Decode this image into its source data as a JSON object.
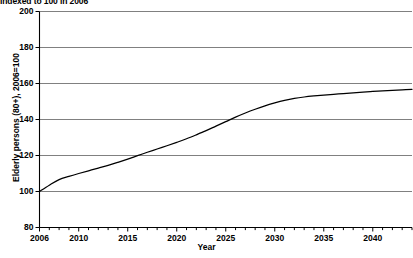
{
  "chart_data": {
    "type": "line",
    "title": "Indexed to 100 in 2006",
    "xlabel": "Year",
    "ylabel": "Elderly persons (80+), 2006=100",
    "xlim": [
      2006,
      2044
    ],
    "ylim": [
      80,
      200
    ],
    "grid": true,
    "legend": "none",
    "y_ticks": [
      80,
      100,
      120,
      140,
      160,
      180,
      200
    ],
    "x_ticks": [
      2006,
      2010,
      2015,
      2020,
      2025,
      2030,
      2035,
      2040
    ],
    "x_minor_tick_interval": 1,
    "line_color": "#000000",
    "grid_color": "#808080",
    "series": [
      {
        "name": "Elderly persons (80+)",
        "x": [
          2006,
          2007,
          2008,
          2009,
          2010,
          2011,
          2012,
          2013,
          2014,
          2015,
          2016,
          2017,
          2018,
          2019,
          2020,
          2021,
          2022,
          2023,
          2024,
          2025,
          2026,
          2027,
          2028,
          2029,
          2030,
          2031,
          2032,
          2033,
          2034,
          2035,
          2036,
          2037,
          2038,
          2039,
          2040,
          2041,
          2042,
          2043,
          2044
        ],
        "values": [
          100.0,
          103.5,
          106.6,
          108.4,
          110.0,
          111.5,
          113.0,
          114.5,
          116.2,
          118.0,
          119.9,
          121.8,
          123.6,
          125.4,
          127.3,
          129.3,
          131.5,
          133.8,
          136.3,
          138.8,
          141.3,
          143.6,
          145.7,
          147.6,
          149.2,
          150.6,
          151.7,
          152.5,
          153.1,
          153.6,
          154.0,
          154.4,
          154.8,
          155.2,
          155.6,
          155.9,
          156.2,
          156.5,
          156.8
        ]
      }
    ]
  },
  "axis": {
    "y_labels": [
      "200",
      "180",
      "160",
      "140",
      "120",
      "100",
      "80"
    ],
    "x_labels": [
      "2006",
      "2010",
      "2015",
      "2020",
      "2025",
      "2030",
      "2035",
      "2040"
    ],
    "x_title": "Year",
    "y_title": "Elderly persons (80+), 2006=100"
  },
  "supertitle": "Indexed to 100 in 2006"
}
